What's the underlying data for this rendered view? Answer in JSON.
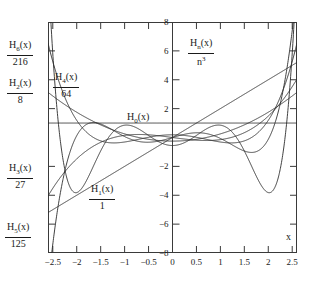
{
  "chart_data": {
    "type": "line",
    "title": "",
    "xlabel": "x",
    "ylabel": "H_n(x) / n^3",
    "ylabel_numerator": "H",
    "xlim": [
      -2.6,
      2.6
    ],
    "ylim": [
      -8,
      8
    ],
    "grid": false,
    "legend_position": "inline-annotations",
    "xticks": [
      "-2.5",
      "-2",
      "-1.5",
      "-1",
      "-0.5",
      "0",
      "0.5",
      "1",
      "1.5",
      "2",
      "2.5"
    ],
    "xtick_values": [
      -2.5,
      -2,
      -1.5,
      -1,
      -0.5,
      0,
      0.5,
      1,
      1.5,
      2,
      2.5
    ],
    "yticks": [
      "8",
      "6",
      "4",
      "2",
      "-2",
      "-4",
      "-6",
      "-8"
    ],
    "ytick_values": [
      8,
      6,
      4,
      2,
      -2,
      -4,
      -6,
      -8
    ],
    "series": [
      {
        "name": "H0(x)",
        "n": 0,
        "divisor": 1,
        "coeffs": [
          1
        ],
        "description": "constant line at y = 1"
      },
      {
        "name": "H1(x)/1",
        "n": 1,
        "divisor": 1,
        "coeffs": [
          0,
          2
        ],
        "description": "straight line y = 2x"
      },
      {
        "name": "H2(x)/8",
        "n": 2,
        "divisor": 8,
        "coeffs": [
          -2,
          0,
          4
        ],
        "description": "parabola (4x^2 - 2)/8"
      },
      {
        "name": "H3(x)/27",
        "n": 3,
        "divisor": 27,
        "coeffs": [
          0,
          -12,
          0,
          8
        ],
        "description": "cubic (8x^3 - 12x)/27"
      },
      {
        "name": "H4(x)/64",
        "n": 4,
        "divisor": 64,
        "coeffs": [
          12,
          0,
          -48,
          0,
          16
        ],
        "description": "quartic (16x^4 - 48x^2 + 12)/64"
      },
      {
        "name": "H5(x)/125",
        "n": 5,
        "divisor": 125,
        "coeffs": [
          0,
          120,
          0,
          -160,
          0,
          32
        ],
        "description": "quintic (32x^5 - 160x^3 + 120x)/125"
      },
      {
        "name": "H6(x)/216",
        "n": 6,
        "divisor": 216,
        "coeffs": [
          -120,
          0,
          720,
          0,
          -480,
          0,
          64
        ],
        "description": "sextic (64x^6 - 480x^4 + 720x^2 - 120)/216"
      }
    ],
    "annotations": [
      {
        "key": "h6",
        "numerator": "H₆(x)",
        "denominator": "216",
        "x_px": 8,
        "y_px": 40
      },
      {
        "key": "h2",
        "numerator": "H₂(x)",
        "denominator": "8",
        "x_px": 8,
        "y_px": 78
      },
      {
        "key": "h4",
        "numerator": "H₄(x)",
        "denominator": "64",
        "x_px": 54,
        "y_px": 72
      },
      {
        "key": "h3",
        "numerator": "H₃(x)",
        "denominator": "27",
        "x_px": 8,
        "y_px": 163
      },
      {
        "key": "h5",
        "numerator": "H₅(x)",
        "denominator": "125",
        "x_px": 8,
        "y_px": 222
      },
      {
        "key": "h1",
        "numerator": "H₁(x)",
        "denominator": "1",
        "x_px": 90,
        "y_px": 184
      },
      {
        "key": "h0",
        "numerator": "H₀(x)",
        "denominator": "",
        "x_px": 128,
        "y_px": 112
      }
    ]
  },
  "labels": {
    "h6_num": "H",
    "h6_sub": "6",
    "h6_tail": "(x)",
    "h6_den": "216",
    "h2_sub": "2",
    "h2_den": "8",
    "h4_sub": "4",
    "h4_den": "64",
    "h3_sub": "3",
    "h3_den": "27",
    "h5_sub": "5",
    "h5_den": "125",
    "h1_sub": "1",
    "h1_den": "1",
    "h0_sub": "0",
    "hn_sub": "n",
    "hn_den": "n",
    "hn_den_sup": "3",
    "x_axis_name": "x",
    "paren": "(x)"
  },
  "axes": {
    "x_ticks": [
      "-2.5",
      "-2",
      "-1.5",
      "-1",
      "-0.5",
      "0",
      "0.5",
      "1",
      "1.5",
      "2",
      "2.5"
    ],
    "y_ticks": [
      "8",
      "6",
      "4",
      "2",
      "-2",
      "-4",
      "-6",
      "-8"
    ]
  },
  "colors": {
    "curve": "#2b2b2b",
    "frame": "#3a3a3a",
    "background": "#ffffff",
    "text": "#1a1a1a"
  }
}
